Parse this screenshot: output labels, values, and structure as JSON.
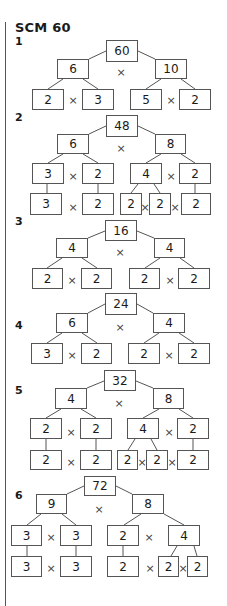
{
  "title": "SCM 60",
  "problems": [
    {
      "label": "1",
      "label_y": 35,
      "boxes": [
        {
          "v": "60",
          "x": 106,
          "y": 40,
          "w": 32,
          "h": 22
        },
        {
          "v": "6",
          "x": 57,
          "y": 59,
          "w": 32,
          "h": 20
        },
        {
          "v": "10",
          "x": 155,
          "y": 59,
          "w": 32,
          "h": 20
        },
        {
          "v": "2",
          "x": 32,
          "y": 89,
          "w": 32,
          "h": 21
        },
        {
          "v": "3",
          "x": 82,
          "y": 89,
          "w": 32,
          "h": 21
        },
        {
          "v": "5",
          "x": 130,
          "y": 89,
          "w": 32,
          "h": 21
        },
        {
          "v": "2",
          "x": 179,
          "y": 89,
          "w": 32,
          "h": 21
        }
      ],
      "times": [
        [
          121,
          72
        ],
        [
          73,
          100
        ],
        [
          171,
          100
        ]
      ],
      "lines": [
        [
          106,
          51,
          89,
          59
        ],
        [
          138,
          51,
          155,
          59
        ],
        [
          63,
          79,
          48,
          89
        ],
        [
          83,
          79,
          98,
          89
        ],
        [
          161,
          79,
          146,
          89
        ],
        [
          181,
          79,
          195,
          89
        ]
      ]
    },
    {
      "label": "2",
      "label_y": 111,
      "boxes": [
        {
          "v": "48",
          "x": 106,
          "y": 115,
          "w": 32,
          "h": 22
        },
        {
          "v": "6",
          "x": 57,
          "y": 134,
          "w": 32,
          "h": 20
        },
        {
          "v": "8",
          "x": 155,
          "y": 134,
          "w": 31,
          "h": 20
        },
        {
          "v": "3",
          "x": 32,
          "y": 163,
          "w": 32,
          "h": 21
        },
        {
          "v": "2",
          "x": 82,
          "y": 163,
          "w": 32,
          "h": 21
        },
        {
          "v": "4",
          "x": 130,
          "y": 163,
          "w": 32,
          "h": 21
        },
        {
          "v": "2",
          "x": 179,
          "y": 163,
          "w": 32,
          "h": 21
        },
        {
          "v": "3",
          "x": 30,
          "y": 193,
          "w": 32,
          "h": 22
        },
        {
          "v": "2",
          "x": 82,
          "y": 193,
          "w": 32,
          "h": 22
        },
        {
          "v": "2",
          "x": 120,
          "y": 193,
          "w": 22,
          "h": 22
        },
        {
          "v": "2",
          "x": 149,
          "y": 193,
          "w": 22,
          "h": 22
        },
        {
          "v": "2",
          "x": 181,
          "y": 193,
          "w": 30,
          "h": 22
        }
      ],
      "times": [
        [
          121,
          148
        ],
        [
          73,
          176
        ],
        [
          171,
          176
        ],
        [
          73,
          207
        ],
        [
          145,
          207
        ],
        [
          175,
          207
        ]
      ],
      "lines": [
        [
          106,
          126,
          89,
          134
        ],
        [
          138,
          126,
          155,
          134
        ],
        [
          63,
          154,
          48,
          163
        ],
        [
          83,
          154,
          98,
          163
        ],
        [
          161,
          154,
          146,
          163
        ],
        [
          181,
          154,
          195,
          163
        ],
        [
          47,
          184,
          47,
          193
        ],
        [
          98,
          184,
          98,
          193
        ],
        [
          138,
          184,
          131,
          193
        ],
        [
          154,
          184,
          160,
          193
        ],
        [
          195,
          184,
          195,
          193
        ]
      ]
    },
    {
      "label": "3",
      "label_y": 215,
      "boxes": [
        {
          "v": "16",
          "x": 105,
          "y": 220,
          "w": 32,
          "h": 21
        },
        {
          "v": "4",
          "x": 56,
          "y": 238,
          "w": 32,
          "h": 20
        },
        {
          "v": "4",
          "x": 154,
          "y": 238,
          "w": 31,
          "h": 20
        },
        {
          "v": "2",
          "x": 32,
          "y": 268,
          "w": 31,
          "h": 21
        },
        {
          "v": "2",
          "x": 81,
          "y": 268,
          "w": 31,
          "h": 21
        },
        {
          "v": "2",
          "x": 129,
          "y": 268,
          "w": 31,
          "h": 21
        },
        {
          "v": "2",
          "x": 178,
          "y": 268,
          "w": 32,
          "h": 21
        }
      ],
      "times": [
        [
          120,
          252
        ],
        [
          72,
          280
        ],
        [
          170,
          280
        ]
      ],
      "lines": [
        [
          105,
          231,
          88,
          238
        ],
        [
          137,
          231,
          154,
          238
        ],
        [
          62,
          258,
          47,
          268
        ],
        [
          82,
          258,
          97,
          268
        ],
        [
          160,
          258,
          145,
          268
        ],
        [
          180,
          258,
          194,
          268
        ]
      ]
    },
    {
      "label": "4",
      "label_y": 319,
      "boxes": [
        {
          "v": "24",
          "x": 105,
          "y": 293,
          "w": 32,
          "h": 22
        },
        {
          "v": "6",
          "x": 56,
          "y": 313,
          "w": 32,
          "h": 20
        },
        {
          "v": "4",
          "x": 153,
          "y": 313,
          "w": 32,
          "h": 20
        },
        {
          "v": "3",
          "x": 31,
          "y": 343,
          "w": 32,
          "h": 21
        },
        {
          "v": "2",
          "x": 81,
          "y": 343,
          "w": 31,
          "h": 21
        },
        {
          "v": "2",
          "x": 128,
          "y": 343,
          "w": 32,
          "h": 21
        },
        {
          "v": "2",
          "x": 178,
          "y": 343,
          "w": 32,
          "h": 21
        }
      ],
      "times": [
        [
          120,
          327
        ],
        [
          72,
          355
        ],
        [
          169,
          355
        ]
      ],
      "lines": [
        [
          105,
          304,
          88,
          313
        ],
        [
          137,
          304,
          153,
          313
        ],
        [
          62,
          333,
          47,
          343
        ],
        [
          82,
          333,
          97,
          343
        ],
        [
          159,
          333,
          144,
          343
        ],
        [
          179,
          333,
          194,
          343
        ]
      ]
    },
    {
      "label": "5",
      "label_y": 384,
      "boxes": [
        {
          "v": "32",
          "x": 104,
          "y": 370,
          "w": 32,
          "h": 21
        },
        {
          "v": "4",
          "x": 55,
          "y": 388,
          "w": 32,
          "h": 21
        },
        {
          "v": "8",
          "x": 153,
          "y": 388,
          "w": 31,
          "h": 21
        },
        {
          "v": "2",
          "x": 30,
          "y": 418,
          "w": 32,
          "h": 21
        },
        {
          "v": "2",
          "x": 80,
          "y": 418,
          "w": 32,
          "h": 21
        },
        {
          "v": "4",
          "x": 127,
          "y": 418,
          "w": 32,
          "h": 21
        },
        {
          "v": "2",
          "x": 177,
          "y": 418,
          "w": 32,
          "h": 21
        },
        {
          "v": "2",
          "x": 30,
          "y": 450,
          "w": 32,
          "h": 20
        },
        {
          "v": "2",
          "x": 80,
          "y": 450,
          "w": 32,
          "h": 20
        },
        {
          "v": "2",
          "x": 117,
          "y": 450,
          "w": 21,
          "h": 20
        },
        {
          "v": "2",
          "x": 146,
          "y": 450,
          "w": 22,
          "h": 20
        },
        {
          "v": "2",
          "x": 177,
          "y": 450,
          "w": 32,
          "h": 20
        }
      ],
      "times": [
        [
          119,
          403
        ],
        [
          71,
          432
        ],
        [
          169,
          432
        ],
        [
          71,
          462
        ],
        [
          142,
          462
        ],
        [
          172,
          462
        ]
      ],
      "lines": [
        [
          104,
          381,
          87,
          388
        ],
        [
          136,
          381,
          153,
          388
        ],
        [
          61,
          409,
          46,
          418
        ],
        [
          81,
          409,
          96,
          418
        ],
        [
          159,
          409,
          143,
          418
        ],
        [
          179,
          409,
          193,
          418
        ],
        [
          46,
          439,
          46,
          450
        ],
        [
          96,
          439,
          96,
          450
        ],
        [
          135,
          439,
          128,
          450
        ],
        [
          151,
          439,
          157,
          450
        ],
        [
          193,
          439,
          193,
          450
        ]
      ]
    },
    {
      "label": "6",
      "label_y": 489,
      "boxes": [
        {
          "v": "72",
          "x": 84,
          "y": 476,
          "w": 32,
          "h": 20
        },
        {
          "v": "9",
          "x": 36,
          "y": 494,
          "w": 31,
          "h": 20
        },
        {
          "v": "8",
          "x": 132,
          "y": 494,
          "w": 32,
          "h": 20
        },
        {
          "v": "3",
          "x": 11,
          "y": 525,
          "w": 31,
          "h": 21
        },
        {
          "v": "3",
          "x": 60,
          "y": 525,
          "w": 32,
          "h": 21
        },
        {
          "v": "2",
          "x": 107,
          "y": 525,
          "w": 32,
          "h": 21
        },
        {
          "v": "4",
          "x": 168,
          "y": 525,
          "w": 32,
          "h": 21
        },
        {
          "v": "3",
          "x": 11,
          "y": 556,
          "w": 31,
          "h": 21
        },
        {
          "v": "3",
          "x": 60,
          "y": 556,
          "w": 32,
          "h": 21
        },
        {
          "v": "2",
          "x": 107,
          "y": 556,
          "w": 32,
          "h": 21
        },
        {
          "v": "2",
          "x": 158,
          "y": 556,
          "w": 21,
          "h": 21
        },
        {
          "v": "2",
          "x": 187,
          "y": 556,
          "w": 21,
          "h": 21
        }
      ],
      "times": [
        [
          99,
          509
        ],
        [
          51,
          537
        ],
        [
          149,
          537
        ],
        [
          51,
          568
        ],
        [
          150,
          568
        ],
        [
          183,
          568
        ]
      ],
      "lines": [
        [
          84,
          486,
          67,
          494
        ],
        [
          116,
          486,
          132,
          494
        ],
        [
          41,
          514,
          27,
          525
        ],
        [
          62,
          514,
          76,
          525
        ],
        [
          141,
          514,
          124,
          525
        ],
        [
          164,
          514,
          184,
          525
        ],
        [
          27,
          546,
          27,
          556
        ],
        [
          76,
          546,
          76,
          556
        ],
        [
          123,
          546,
          123,
          556
        ],
        [
          177,
          546,
          171,
          556
        ],
        [
          194,
          546,
          197,
          556
        ]
      ]
    }
  ]
}
